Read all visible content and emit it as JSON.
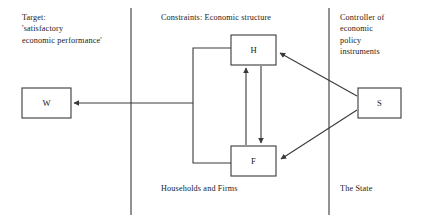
{
  "diagram": {
    "title_text": "Target: 'satisfactory economic performance' constraints and policy diagram",
    "stroke_color": "#3a3a3a",
    "background_color": "#ffffff",
    "panels": [
      {
        "id": "target",
        "heading": "Target:\n'satisfactory\neconomic performance'",
        "footer": ""
      },
      {
        "id": "constraints",
        "heading": "Constraints: Economic structure",
        "footer": "Households and Firms"
      },
      {
        "id": "state",
        "heading": "Controller of\neconomic\npolicy\ninstruments",
        "footer": "The State"
      }
    ],
    "nodes": [
      {
        "id": "W",
        "label": "W",
        "meaning": "welfare-target-box"
      },
      {
        "id": "H",
        "label": "H",
        "meaning": "households-box"
      },
      {
        "id": "F",
        "label": "F",
        "meaning": "firms-box"
      },
      {
        "id": "S",
        "label": "S",
        "meaning": "state-box"
      }
    ],
    "edges": [
      {
        "from": "H",
        "to": "F",
        "style": "arrow-down"
      },
      {
        "from": "F",
        "to": "H",
        "style": "arrow-up"
      },
      {
        "from": "S",
        "to": "H",
        "style": "diagonal-arrow"
      },
      {
        "from": "S",
        "to": "F",
        "style": "diagonal-arrow"
      },
      {
        "from": "HF",
        "to": "W",
        "style": "bracket-arrow-left"
      }
    ]
  }
}
